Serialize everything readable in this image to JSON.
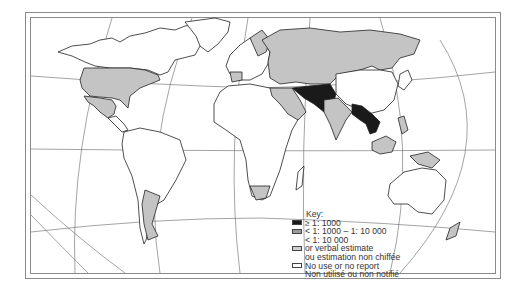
{
  "map": {
    "title": "",
    "projection": "world-oblique",
    "colors": {
      "high": "#1a1a1a",
      "medium": "#b0b0b0",
      "low": "#cfcfcf",
      "none": "#ffffff",
      "border": "#2a2a2a",
      "graticule": "#555555"
    },
    "regions": {
      "high": [
        "Iran",
        "Afghanistan",
        "Pakistan",
        "Myanmar",
        "Thailand",
        "Laos"
      ],
      "medium_or_low": [
        "USA",
        "Mexico",
        "USSR",
        "India",
        "Saudi Arabia",
        "Argentina",
        "South Africa",
        "Indonesia",
        "Papua New Guinea",
        "Malaysia",
        "Philippines",
        "Spain",
        "Scandinavia",
        "Eastern Europe"
      ],
      "none": [
        "Canada",
        "Greenland",
        "South America (most)",
        "Africa (most)",
        "China",
        "Mongolia",
        "Australia",
        "New Zealand"
      ]
    }
  },
  "legend": {
    "title": "Key:",
    "items": [
      {
        "swatch": "high",
        "label": "≥ 1: 1000"
      },
      {
        "swatch": "medium",
        "label": "< 1: 1000 – 1: 10 000"
      },
      {
        "swatch": "none-blank",
        "label": "< 1: 10 000"
      },
      {
        "swatch": "low",
        "label": "or verbal estimate"
      },
      {
        "swatch": "none-blank",
        "label": "ou estimation non chiffée"
      },
      {
        "swatch": "none",
        "label": "No use or no report"
      },
      {
        "swatch": "none-blank",
        "label": "Non utilisé ou non notifié"
      }
    ]
  }
}
